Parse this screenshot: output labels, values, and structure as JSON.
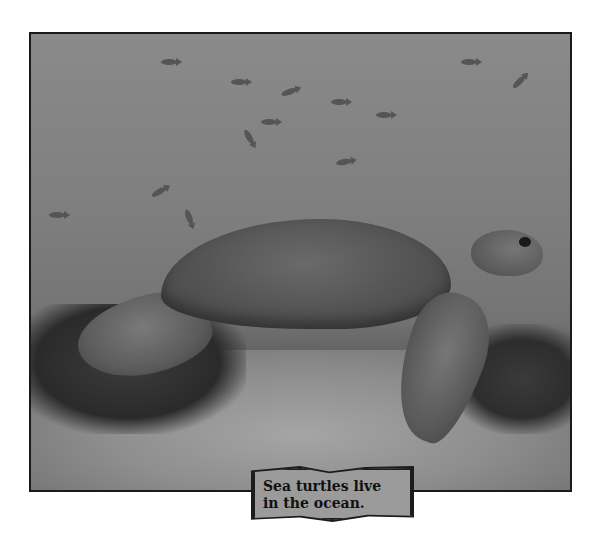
{
  "photo": {
    "subject": "sea turtle swimming over ocean floor with fish",
    "palette": {
      "water": "#808080",
      "frame_border": "#1a1a1a",
      "caption_bg": "#9b9b9b",
      "caption_border": "#1c1c1c"
    }
  },
  "caption": {
    "line1": "Sea turtles live",
    "line2": "in the ocean."
  }
}
